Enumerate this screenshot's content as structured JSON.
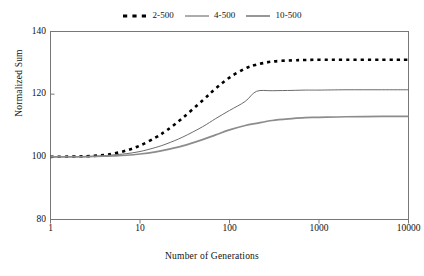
{
  "chart_data": {
    "type": "line",
    "title": "",
    "xlabel": "Number of Generations",
    "ylabel": "Normalized Sum",
    "xscale": "log",
    "xlim": [
      1,
      10000
    ],
    "ylim": [
      80,
      140
    ],
    "xticks": [
      "1",
      "10",
      "100",
      "1000",
      "10000"
    ],
    "xtick_values": [
      1,
      10,
      100,
      1000,
      10000
    ],
    "yticks": [
      "80",
      "100",
      "120",
      "140"
    ],
    "ytick_values": [
      80,
      100,
      120,
      140
    ],
    "grid": false,
    "legend_position": "top-center",
    "x": [
      1,
      2,
      3,
      4,
      5,
      7,
      10,
      15,
      20,
      30,
      50,
      70,
      100,
      150,
      200,
      300,
      500,
      700,
      1000,
      2000,
      5000,
      10000
    ],
    "series": [
      {
        "name": "2-500",
        "style": "dashed",
        "color": "#000000",
        "width": 2.6,
        "plateau": 131.0,
        "values": [
          100.0,
          100.1,
          100.3,
          100.6,
          101.0,
          102.0,
          103.6,
          106.2,
          108.5,
          112.4,
          118.0,
          121.8,
          125.3,
          128.2,
          129.4,
          130.4,
          130.8,
          130.9,
          131.0,
          131.0,
          131.0,
          131.0
        ]
      },
      {
        "name": "4-500",
        "style": "solid",
        "color": "#5a5a5a",
        "width": 0.9,
        "plateau": 121.4,
        "values": [
          100.0,
          100.1,
          100.2,
          100.4,
          100.6,
          101.0,
          101.7,
          103.0,
          104.2,
          106.3,
          109.6,
          112.2,
          114.8,
          117.7,
          120.9,
          121.1,
          121.2,
          121.3,
          121.3,
          121.4,
          121.4,
          121.4
        ]
      },
      {
        "name": "10-500",
        "style": "solid",
        "color": "#8c8c8c",
        "width": 1.7,
        "plateau": 112.9,
        "values": [
          100.0,
          100.0,
          100.1,
          100.2,
          100.3,
          100.5,
          100.9,
          101.6,
          102.3,
          103.5,
          105.5,
          107.0,
          108.6,
          110.0,
          110.7,
          111.6,
          112.2,
          112.5,
          112.6,
          112.8,
          112.9,
          112.9
        ]
      }
    ]
  },
  "legend": {
    "items": [
      {
        "label": "2-500",
        "key": "dashed-key"
      },
      {
        "label": "4-500",
        "key": "thin-line-key"
      },
      {
        "label": "10-500",
        "key": "thick-gray-line-key"
      }
    ]
  },
  "axes": {
    "frame_color": "#777777"
  }
}
